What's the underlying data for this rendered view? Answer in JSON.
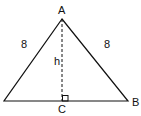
{
  "diagram": {
    "type": "isosceles-triangle",
    "vertices": {
      "A": {
        "label": "A",
        "x": 62,
        "y": 19
      },
      "B": {
        "label": "B",
        "x": 128,
        "y": 101
      },
      "left": {
        "x": 4,
        "y": 101
      },
      "C": {
        "label": "C",
        "x": 62,
        "y": 101
      }
    },
    "side_labels": {
      "left_side": "8",
      "right_side": "8"
    },
    "height_label": "h",
    "right_angle_at": "C",
    "stroke_color": "#111111",
    "background": "#ffffff"
  }
}
